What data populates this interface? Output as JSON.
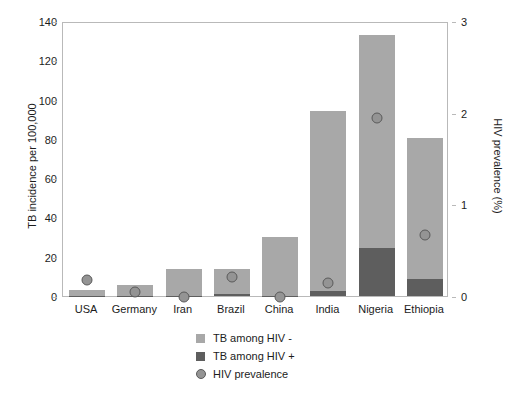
{
  "chart_data": {
    "type": "bar",
    "title": "",
    "subtitle": "",
    "categories": [
      "USA",
      "Germany",
      "Iran",
      "Brazil",
      "China",
      "India",
      "Nigeria",
      "Ethiopia"
    ],
    "xlabel": "",
    "ylabel": "TB incidence per 100,000",
    "ylabel_right": "HIV prevalence (%)",
    "ylim": [
      0,
      140
    ],
    "yticks": [
      0,
      20,
      40,
      60,
      80,
      100,
      120,
      140
    ],
    "ylim_right": [
      0,
      3
    ],
    "yticks_right": [
      0,
      1,
      2,
      3
    ],
    "grid": false,
    "legend_position": "bottom-center",
    "stacked": true,
    "series": [
      {
        "name": "TB among HIV -",
        "axis": "left",
        "kind": "bar",
        "color": "#a8a8a8",
        "values": [
          3.0,
          5.5,
          13.5,
          13.0,
          30.0,
          91.5,
          108.5,
          72.0
        ]
      },
      {
        "name": "TB among HIV +",
        "axis": "left",
        "kind": "bar",
        "color": "#5e5e5e",
        "values": [
          0.1,
          0.2,
          0.1,
          0.8,
          0.2,
          2.5,
          24.5,
          8.7
        ]
      },
      {
        "name": "HIV prevalence",
        "axis": "right",
        "kind": "scatter",
        "color": "#949494",
        "values": [
          0.24,
          0.1,
          0.05,
          0.27,
          0.05,
          0.2,
          2.0,
          0.73
        ]
      }
    ],
    "totals_left": [
      3.1,
      5.7,
      13.6,
      13.8,
      30.2,
      94.0,
      133.0,
      80.7
    ],
    "legend": [
      {
        "label": "TB among HIV -",
        "marker": "square",
        "color": "#a8a8a8"
      },
      {
        "label": "TB among HIV +",
        "marker": "square",
        "color": "#5e5e5e"
      },
      {
        "label": "HIV prevalence",
        "marker": "circle",
        "color": "#949494"
      }
    ]
  },
  "axes": {
    "left_title": "TB incidence per 100,000",
    "right_title": "HIV prevalence (%)",
    "left_ticks": [
      "0",
      "20",
      "40",
      "60",
      "80",
      "100",
      "120",
      "140"
    ],
    "right_ticks": [
      "0",
      "1",
      "2",
      "3"
    ]
  },
  "colors": {
    "bar_hiv_negative": "#a8a8a8",
    "bar_hiv_positive": "#5e5e5e",
    "dot_fill": "#949494",
    "dot_stroke": "#5a5a5a",
    "frame": "#b9b9b9",
    "text": "#1c1c1c",
    "background": "#ffffff"
  }
}
